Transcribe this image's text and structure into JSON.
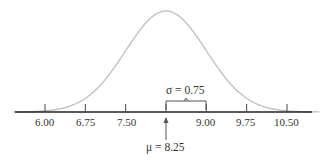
{
  "chart_data": {
    "type": "line",
    "mean": 8.25,
    "sd": 0.75,
    "ticks": [
      "6.00",
      "6.75",
      "7.50",
      "8.25",
      "9.00",
      "9.75",
      "10.50"
    ],
    "tick_values": [
      6.0,
      6.75,
      7.5,
      8.25,
      9.0,
      9.75,
      10.5
    ],
    "visible_tick_labels": [
      "6.00",
      "6.75",
      "7.50",
      "9.00",
      "9.75",
      "10.50"
    ],
    "annotations": [
      "σ = 0.75",
      "μ = 8.25"
    ],
    "curve_color": "#bdbdbd",
    "axis_color": "#222222"
  },
  "labels": {
    "sigma": "σ = 0.75",
    "mu": "μ = 8.25",
    "t0": "6.00",
    "t1": "6.75",
    "t2": "7.50",
    "t4": "9.00",
    "t5": "9.75",
    "t6": "10.50"
  }
}
